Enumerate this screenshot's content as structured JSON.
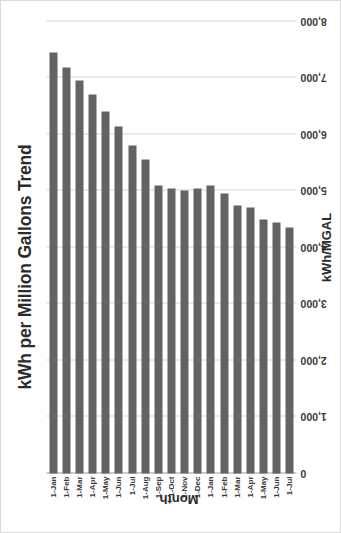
{
  "chart_data": {
    "type": "bar",
    "orientation": "vertical",
    "title": "kWh per Million Gallons Trend",
    "xlabel": "Month",
    "ylabel": "kWh/MGAL",
    "ylim": [
      0,
      8000
    ],
    "ytick_labels": [
      "0",
      "1,000",
      "2,000",
      "3,000",
      "4,000",
      "5,000",
      "6,000",
      "7,000",
      "8,000"
    ],
    "ytick_values": [
      0,
      1000,
      2000,
      3000,
      4000,
      5000,
      6000,
      7000,
      8000
    ],
    "grid": true,
    "legend": false,
    "bar_color": "#636363",
    "categories": [
      "1-Jan",
      "1-Feb",
      "1-Mar",
      "1-Apr",
      "1-May",
      "1-Jun",
      "1-Jul",
      "1-Aug",
      "1-Sep",
      "1-Oct",
      "1-Nov",
      "1-Dec",
      "1-Jan",
      "1-Feb",
      "1-Mar",
      "1-Apr",
      "1-May",
      "1-Jun",
      "1-Jul"
    ],
    "values": [
      7450,
      7180,
      6950,
      6700,
      6400,
      6150,
      5800,
      5550,
      5100,
      5050,
      5000,
      5050,
      5100,
      4950,
      4750,
      4700,
      4500,
      4450,
      4350
    ]
  }
}
